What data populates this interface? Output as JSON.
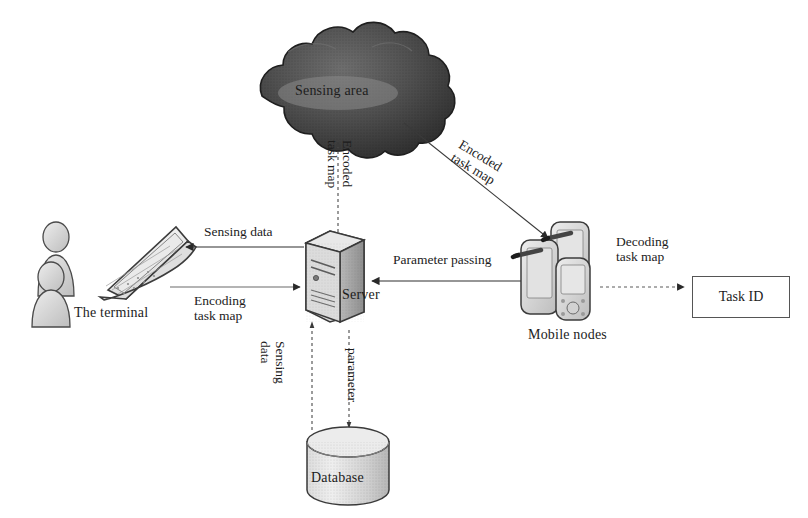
{
  "diagram": {
    "background": "#ffffff",
    "ink": "#1c1c1c",
    "cloud_fill": "#4a4a4a",
    "device_fill": "#d9d9d9"
  },
  "nodes": [
    {
      "id": "sensing-area",
      "label": "Sensing area",
      "shape": "cloud",
      "x": 340,
      "y": 92
    },
    {
      "id": "terminal",
      "label": "The terminal",
      "shape": "laptop",
      "x": 118,
      "y": 313
    },
    {
      "id": "users",
      "label": "",
      "shape": "persons",
      "x": 52,
      "y": 265
    },
    {
      "id": "server",
      "label": "Server",
      "shape": "tower",
      "x": 372,
      "y": 300
    },
    {
      "id": "mobile-nodes",
      "label": "Mobile nodes",
      "shape": "handhelds",
      "x": 565,
      "y": 340
    },
    {
      "id": "task-id",
      "label": "Task ID",
      "shape": "box",
      "x": 730,
      "y": 296
    },
    {
      "id": "database",
      "label": "Database",
      "shape": "cylinder",
      "x": 348,
      "y": 480
    }
  ],
  "edges": [
    {
      "id": "server-to-cloud",
      "label": "Encoded\ntask map",
      "line": "dashed",
      "orientation": "vertical",
      "from": "server",
      "to": "sensing-area"
    },
    {
      "id": "cloud-to-mobile",
      "label": "Encoded\ntask map",
      "line": "solid",
      "orientation": "diagonal",
      "from": "sensing-area",
      "to": "mobile-nodes"
    },
    {
      "id": "server-to-terminal",
      "label": "Sensing data",
      "line": "solid",
      "orientation": "horizontal",
      "from": "server",
      "to": "terminal"
    },
    {
      "id": "terminal-to-server",
      "label": "Encoding\ntask map",
      "line": "solid",
      "orientation": "horizontal",
      "from": "terminal",
      "to": "server"
    },
    {
      "id": "mobile-to-server",
      "label": "Parameter passing",
      "line": "solid",
      "orientation": "horizontal",
      "from": "mobile-nodes",
      "to": "server"
    },
    {
      "id": "mobile-to-taskid",
      "label": "Decoding\ntask map",
      "line": "dashed",
      "orientation": "horizontal",
      "from": "mobile-nodes",
      "to": "task-id"
    },
    {
      "id": "db-to-server",
      "label": "Sensing\ndata",
      "line": "dashed",
      "orientation": "vertical",
      "from": "database",
      "to": "server"
    },
    {
      "id": "server-to-db",
      "label": "parameter",
      "line": "dashed",
      "orientation": "vertical",
      "from": "server",
      "to": "database"
    }
  ],
  "labels": {
    "sensing_area": "Sensing area",
    "the_terminal": "The terminal",
    "server": "Server",
    "mobile_nodes": "Mobile nodes",
    "task_id": "Task ID",
    "database": "Database",
    "encoded_task_map_up_1": "Encoded",
    "encoded_task_map_up_2": "task map",
    "encoded_task_map_diag_1": "Encoded",
    "encoded_task_map_diag_2": "task map",
    "sensing_data": "Sensing data",
    "encoding_1": "Encoding",
    "encoding_2": "task map",
    "parameter_passing": "Parameter passing",
    "decoding_1": "Decoding",
    "decoding_2": "task map",
    "sensing_down_1": "Sensing",
    "sensing_down_2": "data",
    "parameter": "parameter"
  }
}
